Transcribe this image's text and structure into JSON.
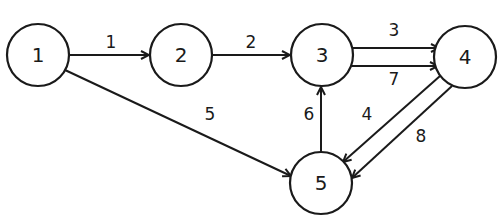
{
  "diagram": {
    "type": "directed-weighted-graph",
    "nodes": [
      {
        "id": "1",
        "label": "1",
        "cx": 38,
        "cy": 55
      },
      {
        "id": "2",
        "label": "2",
        "cx": 181,
        "cy": 55
      },
      {
        "id": "3",
        "label": "3",
        "cx": 322,
        "cy": 55
      },
      {
        "id": "4",
        "label": "4",
        "cx": 465,
        "cy": 57
      },
      {
        "id": "5",
        "label": "5",
        "cx": 321,
        "cy": 183
      }
    ],
    "edges": [
      {
        "from": "1",
        "to": "2",
        "weight": "1"
      },
      {
        "from": "2",
        "to": "3",
        "weight": "2"
      },
      {
        "from": "3",
        "to": "4",
        "weight": "3"
      },
      {
        "from": "3",
        "to": "4",
        "weight": "7"
      },
      {
        "from": "1",
        "to": "5",
        "weight": "5"
      },
      {
        "from": "5",
        "to": "3",
        "weight": "6"
      },
      {
        "from": "4",
        "to": "5",
        "weight": "4"
      },
      {
        "from": "4",
        "to": "5",
        "weight": "8"
      }
    ],
    "stroke_color": "#1a1a1a",
    "background": "#ffffff"
  }
}
